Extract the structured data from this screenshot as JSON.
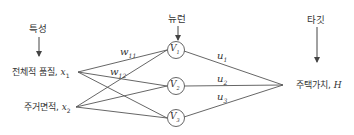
{
  "headers": {
    "features": "특성",
    "neurons": "뉴런",
    "target": "타깃"
  },
  "inputs": [
    {
      "label": "전체적 품질,",
      "var": "x",
      "sub": "1"
    },
    {
      "label": "주거면적,",
      "var": "x",
      "sub": "2"
    }
  ],
  "neurons": [
    {
      "var": "V",
      "sub": "1"
    },
    {
      "var": "V",
      "sub": "2"
    },
    {
      "var": "V",
      "sub": "3"
    }
  ],
  "weights": [
    {
      "var": "w",
      "sub": "11"
    },
    {
      "var": "w",
      "sub": "12"
    }
  ],
  "output_weights": [
    {
      "var": "u",
      "sub": "1"
    },
    {
      "var": "u",
      "sub": "2"
    },
    {
      "var": "u",
      "sub": "3"
    }
  ],
  "output": {
    "label": "주택가치,",
    "var": "H"
  },
  "colors": {
    "line": "#555555",
    "text": "#333333"
  }
}
